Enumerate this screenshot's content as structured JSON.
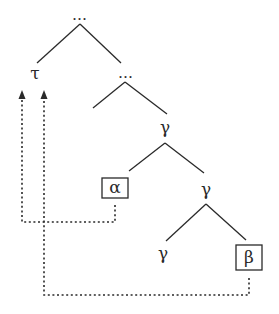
{
  "diagram": {
    "type": "syntax-tree-movement",
    "nodes": {
      "root": {
        "label": "…"
      },
      "tau": {
        "label": "τ"
      },
      "mid": {
        "label": "…"
      },
      "gamma1": {
        "label": "γ"
      },
      "alpha": {
        "label": "α",
        "boxed": true
      },
      "gamma2": {
        "label": "γ"
      },
      "gamma3": {
        "label": "γ"
      },
      "beta": {
        "label": "β",
        "boxed": true
      }
    },
    "edges": [
      [
        "root",
        "tau"
      ],
      [
        "root",
        "mid"
      ],
      [
        "mid",
        "empty-left"
      ],
      [
        "mid",
        "gamma1"
      ],
      [
        "gamma1",
        "alpha"
      ],
      [
        "gamma1",
        "gamma2"
      ],
      [
        "gamma2",
        "gamma3"
      ],
      [
        "gamma2",
        "beta"
      ]
    ],
    "movement_arrows": [
      {
        "from": "alpha",
        "to": "tau",
        "style": "dotted"
      },
      {
        "from": "beta",
        "to": "tau",
        "style": "dotted"
      }
    ],
    "colors": {
      "ink": "#2a2a2a",
      "background": "#ffffff"
    }
  }
}
